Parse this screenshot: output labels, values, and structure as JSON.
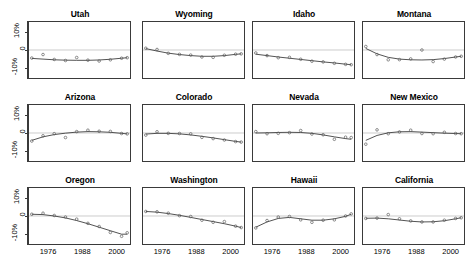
{
  "chart_data": {
    "type": "line",
    "title": "",
    "subtitle": "",
    "xlabel": "",
    "ylabel": "",
    "layout": {
      "rows": 3,
      "cols": 4,
      "shared_x": true,
      "shared_y": true
    },
    "grid": false,
    "legend": "none",
    "reference_line": {
      "y": 0,
      "color": "#bdbdbd"
    },
    "xlim": [
      1969,
      2005
    ],
    "ylim": [
      -16,
      16
    ],
    "xticks": [
      1976,
      1988,
      2000
    ],
    "xticklabels": [
      "1976",
      "1988",
      "2000"
    ],
    "yticks": [
      10,
      0,
      -10
    ],
    "yticklabels": [
      "10%",
      "0",
      "-10%"
    ],
    "x": [
      1970,
      1974,
      1978,
      1982,
      1986,
      1990,
      1994,
      1998,
      2002,
      2004
    ],
    "marker": "open-circle",
    "line_color": "#3a3a3a",
    "marker_color": "#5a5a5a",
    "panels": [
      {
        "name": "Utah",
        "points": [
          -4.6,
          -2.6,
          -5.4,
          -6.0,
          -4.3,
          -5.8,
          -6.3,
          -5.6,
          -4.7,
          -4.4
        ],
        "fit": [
          -4.8,
          -5.2,
          -5.6,
          -5.8,
          -5.9,
          -5.9,
          -5.7,
          -5.3,
          -4.7,
          -4.4
        ]
      },
      {
        "name": "Wyoming",
        "points": [
          1.0,
          0.3,
          -1.9,
          -2.5,
          -2.9,
          -4.0,
          -4.2,
          -3.0,
          -2.4,
          -2.2
        ],
        "fit": [
          0.8,
          -0.6,
          -1.8,
          -2.6,
          -3.2,
          -3.6,
          -3.6,
          -3.2,
          -2.5,
          -2.2
        ]
      },
      {
        "name": "Idaho",
        "points": [
          -1.7,
          -3.2,
          -4.4,
          -4.2,
          -5.3,
          -6.4,
          -6.8,
          -7.6,
          -8.2,
          -8.4
        ],
        "fit": [
          -2.4,
          -3.2,
          -4.0,
          -4.7,
          -5.4,
          -6.1,
          -6.8,
          -7.4,
          -8.1,
          -8.4
        ]
      },
      {
        "name": "Montana",
        "points": [
          2.0,
          -2.6,
          -5.6,
          -5.5,
          -5.1,
          0.0,
          -6.6,
          -5.2,
          -4.0,
          -3.6
        ],
        "fit": [
          0.9,
          -2.2,
          -4.2,
          -5.2,
          -5.6,
          -5.7,
          -5.5,
          -4.9,
          -4.0,
          -3.6
        ]
      },
      {
        "name": "Arizona",
        "points": [
          -4.6,
          -1.6,
          -0.4,
          -2.6,
          0.8,
          1.6,
          1.0,
          0.9,
          -0.3,
          -0.5
        ],
        "fit": [
          -4.2,
          -2.2,
          -0.9,
          -0.1,
          0.5,
          0.8,
          0.7,
          0.4,
          -0.2,
          -0.5
        ]
      },
      {
        "name": "Colorado",
        "points": [
          -1.2,
          0.7,
          -0.2,
          -0.3,
          -0.5,
          -2.5,
          -3.2,
          -4.0,
          -4.9,
          -5.2
        ],
        "fit": [
          -0.6,
          -0.2,
          -0.2,
          -0.5,
          -1.1,
          -1.9,
          -2.8,
          -3.8,
          -4.8,
          -5.2
        ]
      },
      {
        "name": "Nevada",
        "points": [
          0.8,
          -0.4,
          -0.2,
          0.2,
          1.4,
          -0.6,
          -1.0,
          -3.6,
          -2.4,
          -2.6
        ],
        "fit": [
          0.0,
          0.1,
          0.3,
          0.4,
          0.3,
          -0.2,
          -1.1,
          -2.2,
          -3.2,
          -3.6
        ]
      },
      {
        "name": "New Mexico",
        "points": [
          -6.4,
          1.8,
          -0.4,
          0.6,
          1.6,
          -0.3,
          -0.4,
          0.4,
          -0.3,
          -0.4
        ],
        "fit": [
          -4.2,
          -1.4,
          0.1,
          0.7,
          0.8,
          0.5,
          0.2,
          -0.1,
          -0.3,
          -0.4
        ]
      },
      {
        "name": "Oregon",
        "points": [
          1.0,
          1.6,
          0.3,
          -0.6,
          -1.8,
          -4.2,
          -6.0,
          -9.4,
          -11.6,
          -9.6
        ],
        "fit": [
          1.0,
          0.8,
          0.0,
          -1.1,
          -2.6,
          -4.4,
          -6.4,
          -8.4,
          -10.4,
          -10.4
        ]
      },
      {
        "name": "Washington",
        "points": [
          2.6,
          2.4,
          1.6,
          0.2,
          -0.3,
          -2.4,
          -3.6,
          -3.2,
          -5.8,
          -6.6
        ],
        "fit": [
          2.6,
          2.2,
          1.4,
          0.4,
          -0.8,
          -2.0,
          -3.2,
          -4.4,
          -5.8,
          -6.6
        ]
      },
      {
        "name": "Hawaii",
        "points": [
          -6.8,
          -2.6,
          -0.6,
          -0.3,
          -2.2,
          -3.6,
          -2.4,
          -2.2,
          0.0,
          1.2
        ],
        "fit": [
          -6.4,
          -3.4,
          -1.4,
          -0.8,
          -1.6,
          -2.4,
          -2.4,
          -1.6,
          -0.2,
          1.0
        ]
      },
      {
        "name": "California",
        "points": [
          -1.4,
          -1.2,
          0.8,
          -1.6,
          -2.8,
          -3.4,
          -3.4,
          -2.4,
          -1.4,
          -1.0
        ],
        "fit": [
          -1.3,
          -1.2,
          -1.6,
          -2.3,
          -3.0,
          -3.4,
          -3.3,
          -2.7,
          -1.6,
          -1.0
        ]
      }
    ]
  }
}
